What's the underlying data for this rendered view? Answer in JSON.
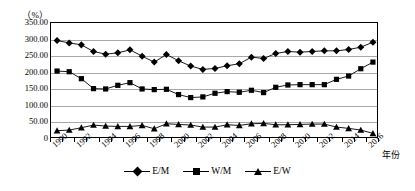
{
  "chart_data": {
    "type": "line",
    "title": "",
    "unit_label": "（%）",
    "xlabel": "年份",
    "ylabel": "",
    "ylim": [
      0,
      350
    ],
    "ytick_values": [
      350,
      300,
      250,
      200,
      150,
      100,
      50,
      0
    ],
    "ytick_labels": [
      "350.00",
      "300.00",
      "250.00",
      "200.00",
      "150.00",
      "100.00",
      "50.00",
      "0"
    ],
    "grid": true,
    "legend_position": "bottom",
    "x": [
      1990,
      1991,
      1992,
      1993,
      1994,
      1995,
      1996,
      1997,
      1998,
      1999,
      2000,
      2001,
      2002,
      2003,
      2004,
      2005,
      2006,
      2007,
      2008,
      2009,
      2010,
      2011,
      2012,
      2013,
      2014,
      2015,
      2016
    ],
    "xtick_labels": [
      "1990",
      "1992",
      "1994",
      "1996",
      "1998",
      "2000",
      "2002",
      "2004",
      "2006",
      "2008",
      "2010",
      "2012",
      "2014",
      "2016"
    ],
    "series": [
      {
        "name": "E/M",
        "marker": "diamond",
        "values": [
          297,
          290,
          284,
          264,
          256,
          260,
          269,
          250,
          232,
          255,
          236,
          220,
          210,
          213,
          221,
          227,
          247,
          243,
          258,
          264,
          262,
          264,
          266,
          266,
          270,
          277,
          292
        ]
      },
      {
        "name": "W/M",
        "marker": "square",
        "values": [
          205,
          203,
          182,
          152,
          151,
          162,
          170,
          151,
          149,
          150,
          134,
          125,
          127,
          138,
          143,
          141,
          147,
          140,
          156,
          163,
          164,
          164,
          164,
          180,
          190,
          212,
          232
        ]
      },
      {
        "name": "E/W",
        "marker": "triangle",
        "values": [
          25,
          27,
          34,
          42,
          39,
          38,
          38,
          41,
          31,
          46,
          44,
          42,
          36,
          36,
          43,
          41,
          46,
          47,
          43,
          43,
          44,
          45,
          45,
          36,
          32,
          27,
          17
        ]
      }
    ]
  },
  "legend": {
    "items": [
      {
        "label": "E/M",
        "marker": "diamond"
      },
      {
        "label": "W/M",
        "marker": "square"
      },
      {
        "label": "E/W",
        "marker": "triangle"
      }
    ]
  }
}
